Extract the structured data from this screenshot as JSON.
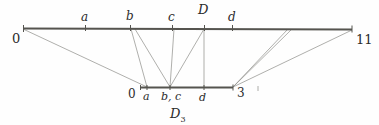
{
  "figure": {
    "caption_label": "D",
    "caption_sub": "3",
    "top_axis": {
      "left_endpoint_label": "0",
      "right_endpoint_label": "11",
      "tick_labels": [
        "a",
        "b",
        "c",
        "d"
      ],
      "point_label": "D"
    },
    "bottom_axis": {
      "left_endpoint_label": "0",
      "right_endpoint_label": "3",
      "tick_labels": [
        "a",
        "b, c",
        "d"
      ]
    },
    "colors": {
      "axis": "#55544f",
      "ray": "#8d8c88",
      "text": "#2b2b2b",
      "background": "#fefefe"
    }
  }
}
